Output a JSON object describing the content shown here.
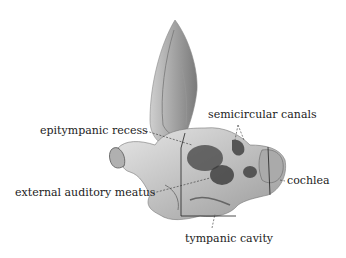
{
  "diagram": {
    "labels": {
      "semicircular_canals": "semicircular canals",
      "epitympanic_recess": "epitympanic recess",
      "cochlea": "cochlea",
      "external_auditory_meatus": "external auditory meatus",
      "tympanic_cavity": "tympanic cavity"
    },
    "colors": {
      "background": "#ffffff",
      "text": "#222222",
      "illustration_dark": "#3a3a3a",
      "illustration_mid": "#8a8a8a",
      "illustration_light": "#d8d8d8"
    }
  }
}
